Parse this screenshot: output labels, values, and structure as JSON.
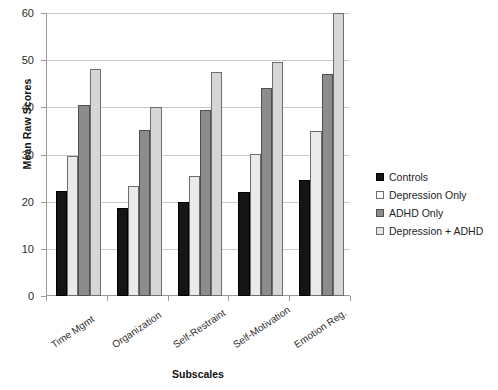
{
  "chart_data": {
    "type": "bar",
    "title": "",
    "subtitle": "",
    "xlabel": "Subscales",
    "ylabel": "Mean Raw Scores",
    "categories": [
      "Time Mgmt",
      "Organization",
      "Self-Restraint",
      "Self-Motivation",
      "Emotion Reg."
    ],
    "series": [
      {
        "name": "Controls",
        "color": "#151515",
        "values": [
          22.2,
          18.6,
          20.0,
          22.0,
          24.5
        ]
      },
      {
        "name": "Depression Only",
        "color": "#eaeaea",
        "values": [
          29.6,
          23.4,
          25.5,
          30.1,
          35.0
        ]
      },
      {
        "name": "ADHD Only",
        "color": "#8c8c8c",
        "values": [
          40.6,
          35.3,
          39.4,
          44.2,
          47.0
        ]
      },
      {
        "name": "Depression + ADHD",
        "color": "#d6d6d6",
        "values": [
          48.1,
          40.1,
          47.6,
          49.6,
          60.5
        ]
      }
    ],
    "ylim": [
      0,
      60
    ],
    "y_ticks": [
      0,
      10,
      20,
      30,
      40,
      50,
      60
    ],
    "y_tick_labels": [
      "0",
      "10",
      "20",
      "30",
      "40",
      "50",
      "60"
    ],
    "grid": "horizontal",
    "legend_position": "right",
    "legend_entries": [
      "Controls",
      "Depression Only",
      "ADHD Only",
      "Depression + ADHD"
    ]
  }
}
